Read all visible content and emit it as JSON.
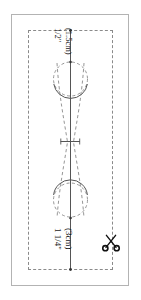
{
  "document": {
    "type": "sewing-pattern-template",
    "title": "Fabric cutting template with fold line and stitch circles",
    "background_color": "#ffffff"
  },
  "frame": {
    "name": "pattern-sheet-border",
    "style": "solid",
    "color": "#b3b3b3"
  },
  "cut_rectangle": {
    "name": "cutting-guide-rectangle",
    "style": "dashed",
    "color": "#8a8a8a"
  },
  "measurements": {
    "top": {
      "inches": "1/2\"",
      "metric": "(1.5cm)",
      "orientation": "rotated-90"
    },
    "bottom": {
      "inches": "1 1/4\"",
      "metric": "(3cm)",
      "orientation": "rotated-90"
    }
  },
  "shapes": {
    "center_line": {
      "name": "center-fold-line",
      "style": "solid",
      "color": "#555555"
    },
    "upper_circle": {
      "name": "upper-stitch-circle",
      "style": "dashed-with-solid-arc",
      "color": "#8a8a8a"
    },
    "lower_circle": {
      "name": "lower-stitch-circle",
      "style": "dashed-with-solid-arc",
      "color": "#8a8a8a"
    },
    "bowtie_curves": {
      "name": "bowtie-seam-curves",
      "style": "dashed",
      "color": "#8a8a8a"
    },
    "center_tick": {
      "name": "center-notch-mark",
      "style": "solid",
      "color": "#555555"
    }
  },
  "icons": {
    "scissors": {
      "name": "scissors-icon",
      "label": "cut here",
      "color": "#111111"
    }
  },
  "colors": {
    "ink": "#1a1a1a",
    "line": "#8a8a8a",
    "frame": "#b3b3b3",
    "solid_line": "#555555"
  }
}
